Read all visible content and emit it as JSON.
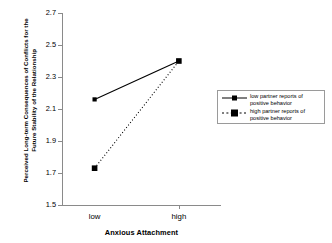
{
  "chart_data": {
    "type": "line",
    "title": "",
    "xlabel": "Anxious Attachment",
    "ylabel_line1": "Perceived Long-term Consequences of Conflicts for the",
    "ylabel_line2": "Future Stability of the Relationship",
    "categories": [
      "low",
      "high"
    ],
    "xticklabels": [
      "low",
      "high"
    ],
    "yticklabels": [
      "2.7",
      "2.5",
      "2.3",
      "2.1",
      "1.9",
      "1.7",
      "1.5"
    ],
    "yticks": [
      2.7,
      2.5,
      2.3,
      2.1,
      1.9,
      1.7,
      1.5
    ],
    "ylim": [
      1.5,
      2.7
    ],
    "grid": false,
    "legend_position": "right",
    "series": [
      {
        "name_line1": "low partner reports of",
        "name_line2": "positive behavior",
        "values": [
          2.16,
          2.4
        ],
        "linestyle": "solid",
        "marker": "square",
        "color": "#000000"
      },
      {
        "name_line1": "high partner reports of",
        "name_line2": "positive behavior",
        "values": [
          1.73,
          2.4
        ],
        "linestyle": "dotted",
        "marker": "square",
        "color": "#000000"
      }
    ]
  },
  "axis": {
    "y_title_line1": "Perceived Long-term Consequences of Conflicts for the",
    "y_title_line2": "Future Stability of the Relationship",
    "x_title": "Anxious Attachment",
    "y_labels": [
      "2.7",
      "2.5",
      "2.3",
      "2.1",
      "1.9",
      "1.7",
      "1.5"
    ],
    "x_labels": [
      "low",
      "high"
    ]
  },
  "legend": {
    "items": [
      {
        "line1": "low partner reports of",
        "line2": "positive behavior"
      },
      {
        "line1": "high partner reports of",
        "line2": "positive behavior"
      }
    ]
  },
  "colors": {
    "axis": "#8a8a8a",
    "series": "#000000",
    "legend_border": "#9a9a9a",
    "background": "#ffffff"
  }
}
